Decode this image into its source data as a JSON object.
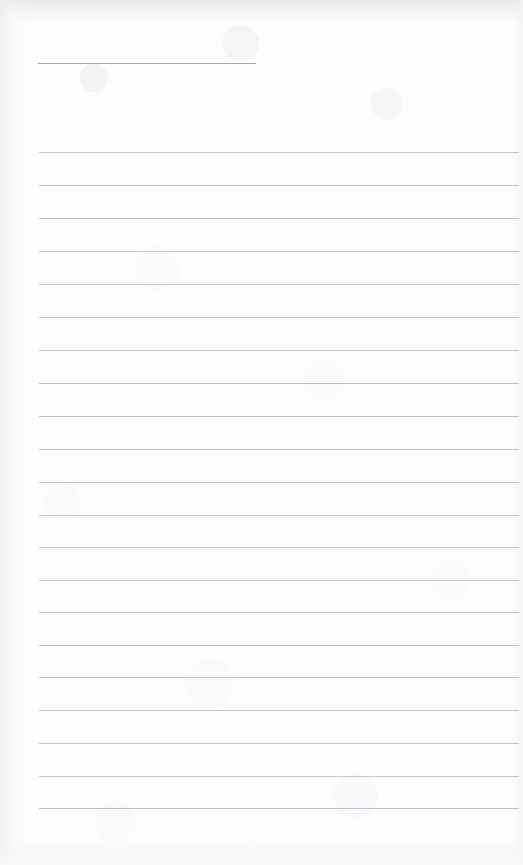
{
  "document": {
    "kind": "scanned-lined-paper",
    "title": "",
    "body_text": "",
    "page_number": "",
    "width_px": 523,
    "height_px": 865
  },
  "paper": {
    "background_color": "#fdfdfe",
    "rule_color": "#b9bcc2",
    "header_rule_color": "#9fa3ab",
    "left_margin_px": 39,
    "right_edge_px": 519,
    "line_spacing_px": 32.8,
    "scan_edge_shadow_color": "#eceef0"
  },
  "rules": {
    "header_rule": {
      "x_start": 38,
      "x_end": 256,
      "y": 63
    },
    "body_rule_y_positions": [
      152,
      185,
      218,
      251,
      284,
      317,
      350,
      383,
      416,
      449,
      482,
      515,
      547,
      580,
      612,
      645,
      677,
      710,
      743,
      776,
      808
    ],
    "body_rule_x_start": 39,
    "body_rule_x_end": 519,
    "body_rule_count": 21
  },
  "content": {
    "lines": [
      {
        "index": 1,
        "text": ""
      },
      {
        "index": 2,
        "text": ""
      },
      {
        "index": 3,
        "text": ""
      },
      {
        "index": 4,
        "text": ""
      },
      {
        "index": 5,
        "text": ""
      },
      {
        "index": 6,
        "text": ""
      },
      {
        "index": 7,
        "text": ""
      },
      {
        "index": 8,
        "text": ""
      },
      {
        "index": 9,
        "text": ""
      },
      {
        "index": 10,
        "text": ""
      },
      {
        "index": 11,
        "text": ""
      },
      {
        "index": 12,
        "text": ""
      },
      {
        "index": 13,
        "text": ""
      },
      {
        "index": 14,
        "text": ""
      },
      {
        "index": 15,
        "text": ""
      },
      {
        "index": 16,
        "text": ""
      },
      {
        "index": 17,
        "text": ""
      },
      {
        "index": 18,
        "text": ""
      },
      {
        "index": 19,
        "text": ""
      },
      {
        "index": 20,
        "text": ""
      },
      {
        "index": 21,
        "text": ""
      }
    ]
  }
}
